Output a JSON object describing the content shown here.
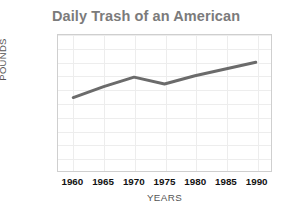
{
  "chart_data": {
    "type": "line",
    "title": "Daily Trash of an American",
    "xlabel": "YEARS",
    "ylabel": "POUNDS",
    "x": [
      1960,
      1965,
      1970,
      1975,
      1980,
      1985,
      1990
    ],
    "xtick_labels": [
      "1960",
      "1965",
      "1970",
      "1975",
      "1980",
      "1985",
      "1990"
    ],
    "ytick_labels": [
      "5.0",
      "4.5",
      "4.0",
      "3.5",
      "3.0",
      "2.5",
      "2.0",
      "1.5",
      "1.0",
      "0.5",
      "0"
    ],
    "ytick_values": [
      5.0,
      4.5,
      4.0,
      3.5,
      3.0,
      2.5,
      2.0,
      1.5,
      1.0,
      0.5,
      0
    ],
    "series": [
      {
        "name": "Pounds of trash per person per day",
        "values": [
          2.7,
          3.1,
          3.45,
          3.2,
          3.5,
          3.75,
          4.0
        ],
        "color": "#6b6b6b"
      }
    ],
    "xlim": [
      1957.5,
      1992.5
    ],
    "ylim": [
      0,
      5.0
    ],
    "grid": true,
    "legend": false,
    "title_color": "#7b7b7b",
    "axis_label_color": "#555555",
    "tick_color": "#111111",
    "grid_color": "#ededed",
    "frame_color": "#cfcfcf",
    "background": "#ffffff"
  }
}
